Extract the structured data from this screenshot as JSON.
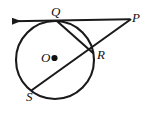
{
  "figure": {
    "stroke_color": "#1a1a1a",
    "fill_color": "#ffffff",
    "background": "#ffffff",
    "labels": {
      "Q": "Q",
      "P": "P",
      "R": "R",
      "O": "O",
      "S": "S"
    },
    "points": {
      "O": {
        "x": 55,
        "y": 60,
        "role": "center"
      },
      "Q": {
        "x": 58,
        "y": 22,
        "role": "tangent-point"
      },
      "P": {
        "x": 130,
        "y": 19,
        "role": "external-point"
      },
      "R": {
        "x": 92,
        "y": 52,
        "role": "secant-near-intersection"
      },
      "S": {
        "x": 33,
        "y": 90,
        "role": "secant-far-intersection"
      },
      "arrow_tip": {
        "x": 4,
        "y": 21,
        "role": "tangent-ray-arrow"
      }
    },
    "circle": {
      "cx": 55,
      "cy": 60,
      "r": 39
    },
    "segments": [
      {
        "name": "tangent-ray-QP",
        "from": "arrow_tip",
        "to": "P"
      },
      {
        "name": "secant-PS",
        "from": "P",
        "to": "S"
      },
      {
        "name": "chord-QR",
        "from": "Q",
        "to": "R"
      }
    ]
  }
}
